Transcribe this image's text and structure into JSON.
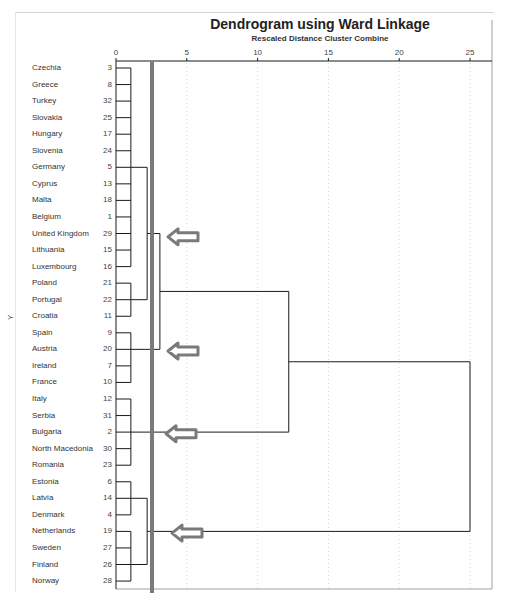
{
  "chart_data": {
    "type": "dendrogram",
    "title": "Dendrogram using Ward Linkage",
    "subtitle": "Rescaled Distance Cluster Combine",
    "ylabel": "Y",
    "xlabel": "Rescaled Distance Cluster Combine",
    "xlim": [
      0,
      25
    ],
    "x_ticks": [
      0,
      5,
      10,
      15,
      20,
      25
    ],
    "grid": "vertical dotted at ticks",
    "cutoff_line_distance": 2.5,
    "leaves": [
      {
        "label": "Czechia",
        "id": 3
      },
      {
        "label": "Greece",
        "id": 8
      },
      {
        "label": "Turkey",
        "id": 32
      },
      {
        "label": "Slovakia",
        "id": 25
      },
      {
        "label": "Hungary",
        "id": 17
      },
      {
        "label": "Slovenia",
        "id": 24
      },
      {
        "label": "Germany",
        "id": 5
      },
      {
        "label": "Cyprus",
        "id": 13
      },
      {
        "label": "Malta",
        "id": 18
      },
      {
        "label": "Belgium",
        "id": 1
      },
      {
        "label": "United Kingdom",
        "id": 29
      },
      {
        "label": "Lithuania",
        "id": 15
      },
      {
        "label": "Luxembourg",
        "id": 16
      },
      {
        "label": "Poland",
        "id": 21
      },
      {
        "label": "Portugal",
        "id": 22
      },
      {
        "label": "Croatia",
        "id": 11
      },
      {
        "label": "Spain",
        "id": 9
      },
      {
        "label": "Austria",
        "id": 20
      },
      {
        "label": "Ireland",
        "id": 7
      },
      {
        "label": "France",
        "id": 10
      },
      {
        "label": "Italy",
        "id": 12
      },
      {
        "label": "Serbia",
        "id": 31
      },
      {
        "label": "Bulgaria",
        "id": 2
      },
      {
        "label": "North Macedonia",
        "id": 30
      },
      {
        "label": "Romania",
        "id": 23
      },
      {
        "label": "Estonia",
        "id": 6
      },
      {
        "label": "Latvia",
        "id": 14
      },
      {
        "label": "Denmark",
        "id": 4
      },
      {
        "label": "Netherlands",
        "id": 19
      },
      {
        "label": "Sweden",
        "id": 27
      },
      {
        "label": "Finland",
        "id": 26
      },
      {
        "label": "Norway",
        "id": 28
      }
    ],
    "clusters_at_cutoff": [
      {
        "name": "Cluster 1",
        "members": [
          "Czechia",
          "Greece",
          "Turkey",
          "Slovakia",
          "Hungary",
          "Slovenia",
          "Germany",
          "Cyprus",
          "Malta",
          "Belgium",
          "United Kingdom",
          "Lithuania",
          "Luxembourg",
          "Poland",
          "Portugal",
          "Croatia"
        ]
      },
      {
        "name": "Cluster 2",
        "members": [
          "Spain",
          "Austria",
          "Ireland",
          "France"
        ]
      },
      {
        "name": "Cluster 3",
        "members": [
          "Italy",
          "Serbia",
          "Bulgaria",
          "North Macedonia",
          "Romania"
        ]
      },
      {
        "name": "Cluster 4",
        "members": [
          "Estonia",
          "Latvia",
          "Denmark",
          "Netherlands",
          "Sweden",
          "Finland",
          "Norway"
        ]
      }
    ],
    "merges": [
      {
        "rows": [
          0,
          12
        ],
        "distance": 1.0
      },
      {
        "rows": [
          13,
          15
        ],
        "distance": 1.0
      },
      {
        "rows": [
          16,
          19
        ],
        "distance": 1.0
      },
      {
        "rows": [
          20,
          24
        ],
        "distance": 1.0
      },
      {
        "rows": [
          25,
          27
        ],
        "distance": 1.0
      },
      {
        "rows": [
          28,
          31
        ],
        "distance": 1.0
      },
      {
        "groups": [
          "rows 0-12",
          "rows 13-15"
        ],
        "distance": 2.2
      },
      {
        "groups": [
          "rows 25-27",
          "rows 28-31"
        ],
        "distance": 2.2
      },
      {
        "groups": [
          "rows 0-15",
          "rows 16-19"
        ],
        "distance": 3.1
      },
      {
        "groups": [
          "rows 0-19",
          "rows 20-24"
        ],
        "distance": 12.2
      },
      {
        "groups": [
          "rows 0-24",
          "rows 25-31"
        ],
        "distance": 25.0
      }
    ],
    "annotations": [
      {
        "type": "arrow",
        "points_to": "Cluster 1",
        "row": 10
      },
      {
        "type": "arrow",
        "points_to": "Cluster 2",
        "row": 17
      },
      {
        "type": "arrow",
        "points_to": "Cluster 3",
        "row": 22
      },
      {
        "type": "arrow",
        "points_to": "Cluster 4",
        "row": 28
      }
    ]
  },
  "colors": {
    "line": "#1a1a1a",
    "cutoff": "#7a7a7a",
    "arrow": "#7a7a7a",
    "grid": "#d8d8d8",
    "border": "#a0a0a0"
  }
}
